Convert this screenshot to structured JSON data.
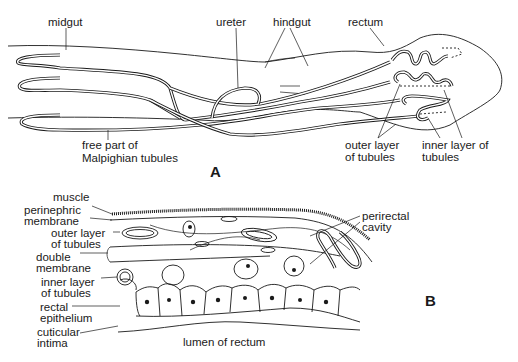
{
  "figure": {
    "panel_a": {
      "label": "A",
      "labels": {
        "midgut": "midgut",
        "ureter": "ureter",
        "hindgut": "hindgut",
        "rectum": "rectum",
        "free_part_line1": "free part of",
        "free_part_line2": "Malpighian tubules",
        "outer_layer_line1": "outer layer",
        "outer_layer_line2": "of tubules",
        "inner_layer_line1": "inner layer of",
        "inner_layer_line2": "tubules"
      }
    },
    "panel_b": {
      "label": "B",
      "labels": {
        "muscle": "muscle",
        "perinephric_line1": "perinephric",
        "perinephric_line2": "membrane",
        "outer_layer_line1": "outer layer",
        "outer_layer_line2": "of tubules",
        "double_membrane_line1": "double",
        "double_membrane_line2": "membrane",
        "inner_layer_line1": "inner layer",
        "inner_layer_line2": "of tubules",
        "rectal_epithelium_line1": "rectal",
        "rectal_epithelium_line2": "epithelium",
        "cuticular_intima_line1": "cuticular",
        "cuticular_intima_line2": "intima",
        "lumen": "lumen of rectum",
        "perirectal_line1": "perirectal",
        "perirectal_line2": "cavity"
      }
    }
  }
}
